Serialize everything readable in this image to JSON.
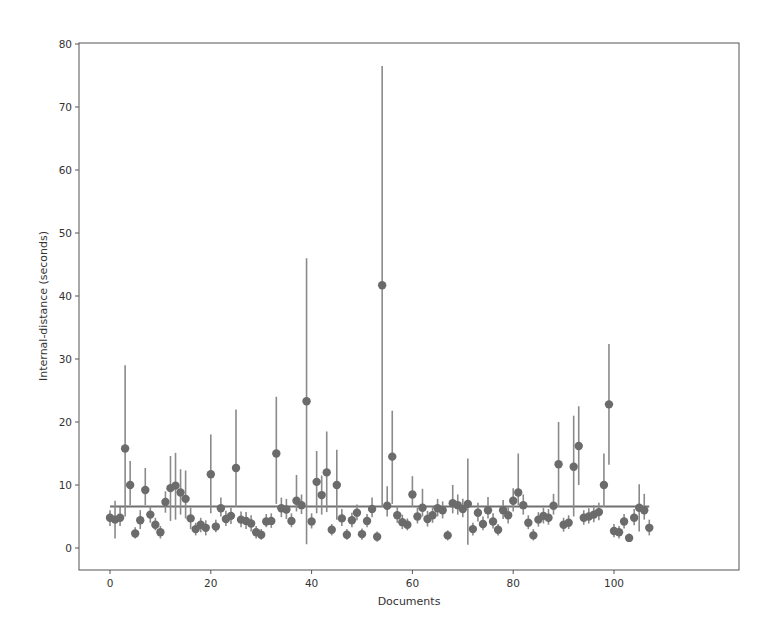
{
  "chart_data": {
    "type": "scatter",
    "subtype": "errorbar",
    "title": "",
    "xlabel": "Documents",
    "ylabel": "Internal-distance (seconds)",
    "xlim": [
      -5,
      112
    ],
    "ylim": [
      -3.5,
      80
    ],
    "xticks": [
      0,
      20,
      40,
      60,
      80,
      100
    ],
    "yticks": [
      0,
      10,
      20,
      30,
      40,
      50,
      60,
      70,
      80
    ],
    "grid": false,
    "legend": null,
    "colors": {
      "marker": "#6b6b6b",
      "errorbar": "#8a8a8a",
      "mean_line": "#707070",
      "axis": "#555555"
    },
    "mean_line": {
      "y": 6.6,
      "x_start": 0,
      "x_end": 107
    },
    "series": [
      {
        "name": "documents",
        "x": [
          0,
          1,
          2,
          3,
          4,
          5,
          6,
          7,
          8,
          9,
          10,
          11,
          12,
          13,
          14,
          15,
          16,
          17,
          18,
          19,
          20,
          21,
          22,
          23,
          24,
          25,
          26,
          27,
          28,
          29,
          30,
          31,
          32,
          33,
          34,
          35,
          36,
          37,
          38,
          39,
          40,
          41,
          42,
          43,
          44,
          45,
          46,
          47,
          48,
          49,
          50,
          51,
          52,
          53,
          54,
          55,
          56,
          57,
          58,
          59,
          60,
          61,
          62,
          63,
          64,
          65,
          66,
          67,
          68,
          69,
          70,
          71,
          72,
          73,
          74,
          75,
          76,
          77,
          78,
          79,
          80,
          81,
          82,
          83,
          84,
          85,
          86,
          87,
          88,
          89,
          90,
          91,
          92,
          93,
          94,
          95,
          96,
          97,
          98,
          99,
          100,
          101,
          102,
          103,
          104,
          105,
          106,
          107
        ],
        "y": [
          4.8,
          4.5,
          4.8,
          15.8,
          10.0,
          2.3,
          4.4,
          9.2,
          5.3,
          3.7,
          2.5,
          7.3,
          9.5,
          9.9,
          8.8,
          7.8,
          4.7,
          3.0,
          3.7,
          3.2,
          11.7,
          3.4,
          6.3,
          4.6,
          5.1,
          12.7,
          4.5,
          4.3,
          3.9,
          2.5,
          2.1,
          4.2,
          4.3,
          15.0,
          6.3,
          6.1,
          4.3,
          7.5,
          6.8,
          23.3,
          4.2,
          10.5,
          8.4,
          12.0,
          2.9,
          10.0,
          4.7,
          2.1,
          4.4,
          5.6,
          2.2,
          4.3,
          6.2,
          1.8,
          41.7,
          6.7,
          14.5,
          5.2,
          4.1,
          3.7,
          8.5,
          5.0,
          6.4,
          4.6,
          5.2,
          6.3,
          6.0,
          2.0,
          7.1,
          6.8,
          6.2,
          7.0,
          3.0,
          5.6,
          3.8,
          6.0,
          4.2,
          2.9,
          6.0,
          5.2,
          7.5,
          8.8,
          6.8,
          4.0,
          2.0,
          4.5,
          5.1,
          4.8,
          6.7,
          13.3,
          3.7,
          4.0,
          12.9,
          16.2,
          4.8,
          5.0,
          5.3,
          5.7,
          10.0,
          22.8,
          2.7,
          2.5,
          4.2,
          1.6,
          4.8,
          6.4,
          6.0,
          3.2
        ],
        "err_low": [
          3.5,
          1.5,
          3.5,
          5.0,
          6.8,
          1.5,
          3.0,
          6.8,
          4.0,
          2.8,
          1.5,
          5.6,
          4.3,
          4.5,
          5.3,
          4.7,
          3.0,
          2.0,
          2.5,
          2.0,
          5.5,
          2.5,
          5.0,
          3.5,
          3.8,
          6.5,
          3.3,
          3.0,
          2.6,
          1.5,
          1.3,
          3.3,
          3.2,
          7.0,
          4.9,
          4.6,
          3.3,
          5.8,
          5.4,
          0.6,
          3.1,
          5.5,
          5.3,
          5.7,
          2.0,
          4.5,
          3.5,
          1.3,
          3.3,
          4.4,
          1.3,
          3.3,
          4.9,
          1.0,
          6.5,
          5.0,
          7.0,
          4.0,
          3.0,
          2.8,
          6.5,
          3.9,
          5.0,
          3.4,
          4.0,
          5.0,
          4.7,
          1.2,
          5.5,
          5.3,
          4.9,
          0.5,
          2.0,
          4.2,
          2.8,
          4.7,
          3.1,
          2.0,
          4.6,
          3.9,
          5.8,
          6.8,
          5.3,
          3.0,
          1.2,
          3.4,
          3.9,
          3.7,
          5.3,
          6.5,
          2.6,
          3.0,
          5.0,
          10.0,
          3.7,
          3.9,
          4.1,
          4.4,
          6.5,
          13.2,
          1.7,
          1.5,
          3.1,
          1.0,
          3.6,
          2.6,
          4.5,
          2.0
        ],
        "err_high": [
          6.0,
          7.5,
          6.5,
          29.0,
          13.8,
          3.3,
          6.0,
          12.7,
          6.6,
          4.8,
          3.5,
          9.0,
          14.6,
          15.1,
          12.5,
          12.3,
          6.4,
          4.0,
          4.8,
          4.4,
          18.0,
          4.5,
          8.0,
          5.9,
          6.4,
          22.0,
          5.8,
          5.7,
          5.2,
          3.5,
          3.0,
          5.4,
          5.5,
          24.0,
          8.0,
          7.8,
          5.5,
          11.6,
          8.5,
          46.0,
          5.5,
          15.4,
          11.5,
          18.5,
          3.8,
          15.6,
          6.2,
          3.0,
          5.6,
          6.9,
          3.1,
          5.4,
          8.0,
          2.6,
          76.5,
          9.8,
          21.8,
          6.6,
          5.3,
          4.7,
          11.4,
          6.4,
          9.4,
          5.9,
          6.5,
          7.8,
          7.4,
          2.8,
          10.0,
          8.5,
          7.8,
          14.2,
          4.0,
          7.2,
          5.0,
          8.1,
          5.5,
          3.8,
          7.6,
          6.6,
          9.5,
          15.0,
          8.5,
          5.2,
          3.0,
          5.7,
          6.4,
          6.2,
          8.6,
          20.0,
          4.8,
          5.2,
          21.0,
          22.5,
          6.0,
          6.3,
          6.8,
          7.2,
          15.0,
          32.4,
          3.8,
          3.5,
          5.4,
          2.3,
          6.2,
          10.1,
          8.6,
          4.5
        ]
      }
    ]
  }
}
